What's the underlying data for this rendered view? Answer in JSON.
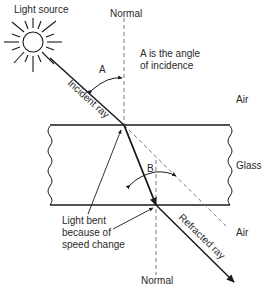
{
  "diagram": {
    "labels": {
      "light_source": "Light source",
      "normal_top": "Normal",
      "normal_bottom": "Normal",
      "angle_a": "A",
      "angle_a_desc_line1": "A is the angle",
      "angle_a_desc_line2": "of incidence",
      "incident_ray": "Incident ray",
      "air_top": "Air",
      "glass": "Glass",
      "angle_b": "B",
      "light_bent_line1": "Light bent",
      "light_bent_line2": "because of",
      "light_bent_line3": "speed change",
      "air_bottom": "Air",
      "refracted_ray": "Refracted ray"
    },
    "colors": {
      "line": "#1a1a1a",
      "dashed": "#777777",
      "text": "#2a2a2a",
      "background": "#ffffff"
    }
  }
}
